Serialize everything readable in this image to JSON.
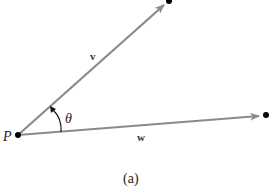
{
  "diagram": {
    "origin_label": "P",
    "angle_label": "θ",
    "caption": "(a)",
    "vectors": [
      {
        "name": "v",
        "label": "v"
      },
      {
        "name": "w",
        "label": "w"
      }
    ],
    "colors": {
      "vector_line": "#888888",
      "point": "#000000",
      "text": "#222222"
    }
  }
}
